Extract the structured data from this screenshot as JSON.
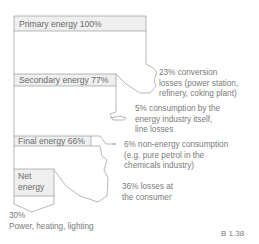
{
  "diagram": {
    "stages": [
      {
        "label": "Primary energy 100%",
        "value": 100
      },
      {
        "label": "Secondary energy 77%",
        "value": 77
      },
      {
        "label": "Final energy 66%",
        "value": 66
      },
      {
        "label_line1": "Net",
        "label_line2": "energy"
      }
    ],
    "losses": [
      {
        "lines": [
          "23% conversion",
          "losses (power station,",
          "refinery, coking plant)"
        ],
        "value": 23
      },
      {
        "lines": [
          "5% consumption by the",
          "energy industry itself,",
          "line losses"
        ],
        "value": 5
      },
      {
        "lines": [
          "6% non-energy consumption",
          "(e.g. pure petrol in the",
          "chemicals industry)"
        ],
        "value": 6
      },
      {
        "lines": [
          "36% losses at",
          "the consumer"
        ],
        "value": 36
      }
    ],
    "output": {
      "line1": "30%",
      "line2": "Power, heating, lighting",
      "value": 30
    },
    "figure_id": "B 1.38",
    "colors": {
      "box_fill": "#efefef",
      "line": "#9a9a9a",
      "text": "#6e6e6e"
    }
  }
}
